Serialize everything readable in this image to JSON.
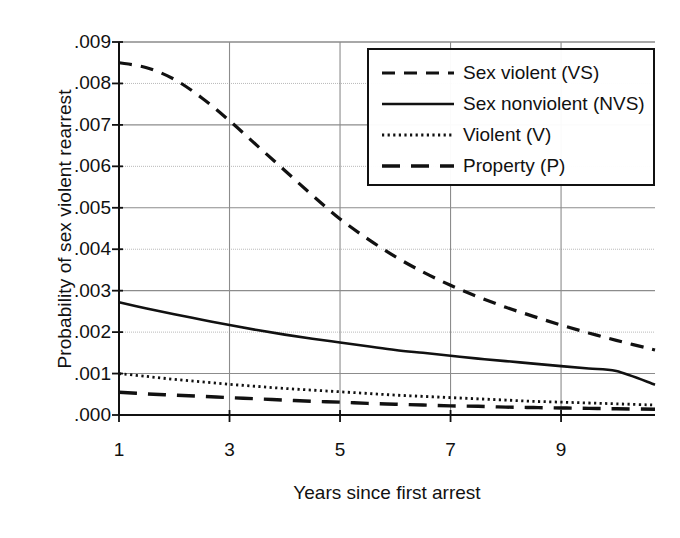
{
  "chart_data": {
    "type": "line",
    "title": "",
    "xlabel": "Years since first arrest",
    "ylabel": "Probability of sex violent rearrest",
    "xlim": [
      1,
      10.7
    ],
    "ylim": [
      0.0,
      0.009
    ],
    "grid": true,
    "legend_position": "top-right",
    "xticks": [
      1,
      3,
      5,
      7,
      9
    ],
    "xtick_labels": [
      "1",
      "3",
      "5",
      "7",
      "9"
    ],
    "yticks": [
      0.0,
      0.001,
      0.002,
      0.003,
      0.004,
      0.005,
      0.006,
      0.007,
      0.008,
      0.009
    ],
    "ytick_labels": [
      ".000",
      ".001",
      ".002",
      ".003",
      ".004",
      ".005",
      ".006",
      ".007",
      ".008",
      ".009"
    ],
    "x": [
      1,
      1.5,
      2,
      2.5,
      3,
      3.5,
      4,
      4.5,
      5,
      5.5,
      6,
      6.5,
      7,
      7.5,
      8,
      8.5,
      9,
      9.5,
      10,
      10.7
    ],
    "series": [
      {
        "name": "Sex violent (VS)",
        "key": "VS",
        "style": "dashed",
        "values": [
          0.0085,
          0.00838,
          0.0081,
          0.00765,
          0.0071,
          0.0065,
          0.0059,
          0.0053,
          0.00473,
          0.00425,
          0.00382,
          0.00345,
          0.00313,
          0.00285,
          0.0026,
          0.00238,
          0.00217,
          0.00198,
          0.0018,
          0.00157
        ]
      },
      {
        "name": "Sex nonviolent (NVS)",
        "key": "NVS",
        "style": "solid",
        "values": [
          0.00272,
          0.00257,
          0.00243,
          0.0023,
          0.00217,
          0.00205,
          0.00194,
          0.00184,
          0.00175,
          0.00166,
          0.00157,
          0.0015,
          0.00143,
          0.00136,
          0.0013,
          0.00124,
          0.00118,
          0.00112,
          0.00106,
          0.00073
        ]
      },
      {
        "name": "Violent (V)",
        "key": "V",
        "style": "dotted",
        "values": [
          0.001,
          0.00093,
          0.00086,
          0.0008,
          0.00074,
          0.00069,
          0.00064,
          0.0006,
          0.00056,
          0.00052,
          0.00048,
          0.00045,
          0.00042,
          0.00039,
          0.00036,
          0.00033,
          0.00031,
          0.00029,
          0.00027,
          0.00024
        ]
      },
      {
        "name": "Property (P)",
        "key": "P",
        "style": "longdash",
        "values": [
          0.00055,
          0.00051,
          0.00048,
          0.00045,
          0.00042,
          0.00039,
          0.00036,
          0.00033,
          0.00031,
          0.00028,
          0.00026,
          0.00024,
          0.00022,
          0.00021,
          0.00019,
          0.00018,
          0.00017,
          0.00016,
          0.00015,
          0.00014
        ]
      }
    ]
  },
  "legend": {
    "items": [
      {
        "label": "Sex violent (VS)",
        "style": "dashed"
      },
      {
        "label": "Sex nonviolent (NVS)",
        "style": "solid"
      },
      {
        "label": "Violent (V)",
        "style": "dotted"
      },
      {
        "label": "Property (P)",
        "style": "longdash"
      }
    ]
  },
  "axes": {
    "x_title": "Years since first arrest",
    "y_title": "Probability of sex violent rearrest"
  },
  "colors": {
    "line": "#111111",
    "grid": "#8c8c8c",
    "grid_minor": "#b9b9b9",
    "axis": "#111111",
    "background": "#ffffff"
  }
}
